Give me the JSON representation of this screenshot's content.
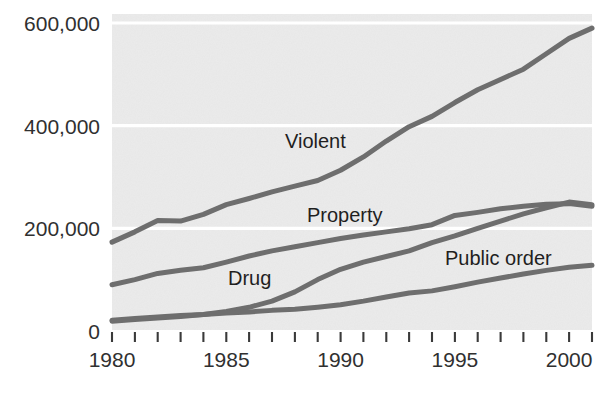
{
  "chart_data": {
    "type": "line",
    "title": "",
    "subtitle": "",
    "xlabel": "",
    "ylabel": "",
    "xlim": [
      1980,
      2001
    ],
    "ylim": [
      0,
      640000
    ],
    "grid": "horizontal-white-gridlines",
    "legend_position": "inline-labels",
    "plot_background": "#ebebeb",
    "line_color": "#6e6e6e",
    "gridline_color": "#ffffff",
    "y_ticks": [
      0,
      200000,
      400000,
      600000
    ],
    "y_tick_labels": [
      "0",
      "200,000",
      "400,000",
      "600,000"
    ],
    "x_ticks": [
      1980,
      1981,
      1982,
      1983,
      1984,
      1985,
      1986,
      1987,
      1988,
      1989,
      1990,
      1991,
      1992,
      1993,
      1994,
      1995,
      1996,
      1997,
      1998,
      1999,
      2000,
      2001
    ],
    "x_tick_labels_shown": [
      "1980",
      "1985",
      "1990",
      "1995",
      "2000"
    ],
    "x": [
      1980,
      1981,
      1982,
      1983,
      1984,
      1985,
      1986,
      1987,
      1988,
      1989,
      1990,
      1991,
      1992,
      1993,
      1994,
      1995,
      1996,
      1997,
      1998,
      1999,
      2000,
      2001
    ],
    "series": [
      {
        "name": "Violent",
        "label": "Violent",
        "label_x": 1987.2,
        "label_y": 400000,
        "color": "#6e6e6e",
        "values": [
          173000,
          193000,
          215000,
          214000,
          227000,
          246000,
          258000,
          271000,
          282000,
          293000,
          313000,
          339000,
          370000,
          398000,
          418000,
          445000,
          470000,
          490000,
          510000,
          540000,
          570000,
          590000
        ]
      },
      {
        "name": "Property",
        "label": "Property",
        "label_x": 1991.5,
        "label_y": 225000,
        "color": "#6e6e6e",
        "values": [
          90000,
          100000,
          112000,
          118000,
          123000,
          134000,
          146000,
          156000,
          164000,
          172000,
          180000,
          187000,
          193000,
          199000,
          207000,
          225000,
          231000,
          238000,
          243000,
          247000,
          248000,
          243000
        ]
      },
      {
        "name": "Drug",
        "label": "Drug",
        "label_x": 1985.1,
        "label_y": 100000,
        "color": "#6e6e6e",
        "values": [
          19000,
          22000,
          25000,
          28000,
          32000,
          38000,
          46000,
          58000,
          76000,
          100000,
          120000,
          134000,
          145000,
          156000,
          172000,
          185000,
          200000,
          214000,
          228000,
          240000,
          251000,
          246000
        ]
      },
      {
        "name": "Public order",
        "label": "Public order",
        "label_x": 1994.2,
        "label_y": 150000,
        "color": "#6e6e6e",
        "values": [
          21000,
          24000,
          27000,
          30000,
          32000,
          35000,
          37000,
          40000,
          42000,
          46000,
          51000,
          58000,
          66000,
          74000,
          78000,
          86000,
          95000,
          103000,
          111000,
          118000,
          124000,
          128000
        ]
      }
    ]
  },
  "axes": {
    "y_labels": [
      "600,000",
      "400,000",
      "200,000",
      "0"
    ],
    "x_labels": [
      "1980",
      "1985",
      "1990",
      "1995",
      "2000"
    ]
  },
  "labels": {
    "violent": "Violent",
    "property": "Property",
    "drug": "Drug",
    "public_order": "Public order"
  }
}
